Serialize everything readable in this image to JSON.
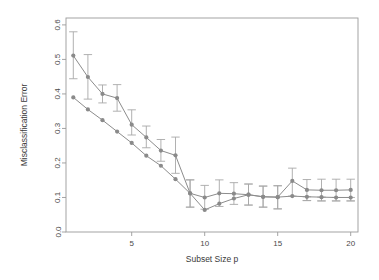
{
  "chart_data": {
    "type": "line",
    "title": "",
    "subtitle": "",
    "xlabel": "Subset Size p",
    "ylabel": "Misclassification Error",
    "xlim": [
      0.5,
      20.5
    ],
    "ylim": [
      0.0,
      0.62
    ],
    "grid": false,
    "legend": "none",
    "xticks": [
      5,
      10,
      15,
      20
    ],
    "xtick_labels": [
      "5",
      "10",
      "15",
      "20"
    ],
    "yticks": [
      0.0,
      0.1,
      0.2,
      0.3,
      0.4,
      0.5,
      0.6
    ],
    "ytick_labels": [
      "0.0",
      "0.1",
      "0.2",
      "0.3",
      "0.4",
      "0.5",
      "0.6"
    ],
    "x": [
      1,
      2,
      3,
      4,
      5,
      6,
      7,
      8,
      9,
      10,
      11,
      12,
      13,
      14,
      15,
      16,
      17,
      18,
      19,
      20
    ],
    "series": [
      {
        "name": "upper",
        "values": [
          0.511,
          0.449,
          0.4,
          0.388,
          0.311,
          0.274,
          0.236,
          0.222,
          0.112,
          0.1,
          0.112,
          0.111,
          0.108,
          0.102,
          0.101,
          0.148,
          0.122,
          0.121,
          0.121,
          0.122
        ],
        "err_low": [
          0.444,
          0.385,
          0.374,
          0.35,
          0.281,
          0.244,
          0.205,
          0.17,
          0.072,
          0.066,
          0.074,
          0.08,
          0.078,
          0.072,
          0.067,
          0.104,
          0.091,
          0.09,
          0.09,
          0.09
        ],
        "err_high": [
          0.58,
          0.514,
          0.426,
          0.427,
          0.354,
          0.307,
          0.268,
          0.275,
          0.151,
          0.135,
          0.151,
          0.143,
          0.139,
          0.133,
          0.134,
          0.185,
          0.152,
          0.153,
          0.153,
          0.153
        ],
        "marker": "circle",
        "color": "#8a8a8a"
      },
      {
        "name": "lower",
        "values": [
          0.39,
          0.355,
          0.324,
          0.291,
          0.258,
          0.221,
          0.192,
          0.153,
          0.112,
          0.064,
          0.082,
          0.097,
          0.108,
          0.102,
          0.101,
          0.104,
          0.102,
          0.101,
          0.1,
          0.1
        ],
        "err_low": [
          0.39,
          0.355,
          0.324,
          0.291,
          0.258,
          0.221,
          0.192,
          0.153,
          0.072,
          0.064,
          0.082,
          0.097,
          0.078,
          0.072,
          0.067,
          0.104,
          0.091,
          0.09,
          0.09,
          0.09
        ],
        "err_high": [
          0.39,
          0.355,
          0.324,
          0.291,
          0.258,
          0.221,
          0.192,
          0.153,
          0.151,
          0.064,
          0.082,
          0.097,
          0.139,
          0.133,
          0.134,
          0.104,
          0.102,
          0.101,
          0.1,
          0.1
        ],
        "marker": "circle",
        "color": "#8a8a8a"
      }
    ]
  },
  "style": {
    "axis_color": "#9a9a9a",
    "point_color": "#8a8a8a",
    "errbar_color": "#a8a8a8",
    "text_color": "#3a3a3a",
    "background": "#ffffff"
  }
}
